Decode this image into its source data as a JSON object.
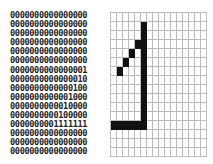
{
  "matrix": {
    "rows": [
      "0000000000000000",
      "0000000000000000",
      "0000000000000000",
      "0000000000000000",
      "0000000000000000",
      "0000000000000000",
      "0000000000000001",
      "0000000000000010",
      "0000000000000100",
      "0000000000001000",
      "0000000000010000",
      "0000000000100000",
      "0000000001111111",
      "0000000000000000",
      "0000000000000000",
      "0000000000000000"
    ]
  },
  "grid": {
    "cols": 16,
    "rows": 16,
    "filled": [
      [
        1,
        5
      ],
      [
        2,
        5
      ],
      [
        3,
        4
      ],
      [
        3,
        5
      ],
      [
        4,
        3
      ],
      [
        4,
        5
      ],
      [
        5,
        2
      ],
      [
        5,
        5
      ],
      [
        6,
        1
      ],
      [
        6,
        5
      ],
      [
        7,
        5
      ],
      [
        8,
        5
      ],
      [
        9,
        5
      ],
      [
        10,
        5
      ],
      [
        11,
        5
      ],
      [
        12,
        0
      ],
      [
        12,
        1
      ],
      [
        12,
        2
      ],
      [
        12,
        3
      ],
      [
        12,
        4
      ],
      [
        12,
        5
      ]
    ],
    "fill_color": "#111111",
    "line_color": "#bbbbbb"
  }
}
